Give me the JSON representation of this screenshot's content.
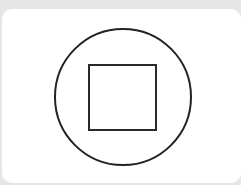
{
  "control": {
    "icon": "stop-icon",
    "shape": "circle-with-square",
    "stroke_color": "#222222",
    "background": "#ffffff"
  }
}
